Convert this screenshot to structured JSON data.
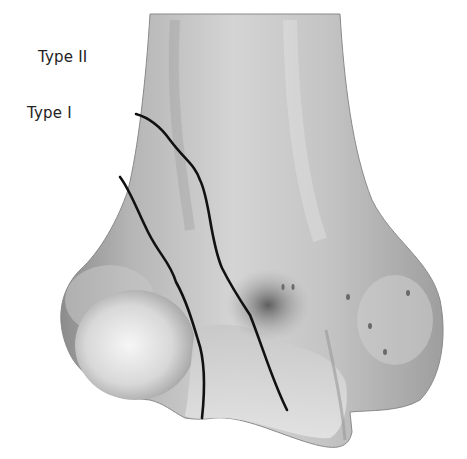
{
  "figure": {
    "labels": [
      {
        "id": "type2",
        "text": "Type II"
      },
      {
        "id": "type1",
        "text": "Type I"
      }
    ],
    "colors": {
      "background": "#ffffff",
      "bone_light": "#e8e8e8",
      "bone_mid": "#b8b8b8",
      "bone_dark": "#7a7a7a",
      "fracture_line": "#111111"
    }
  }
}
